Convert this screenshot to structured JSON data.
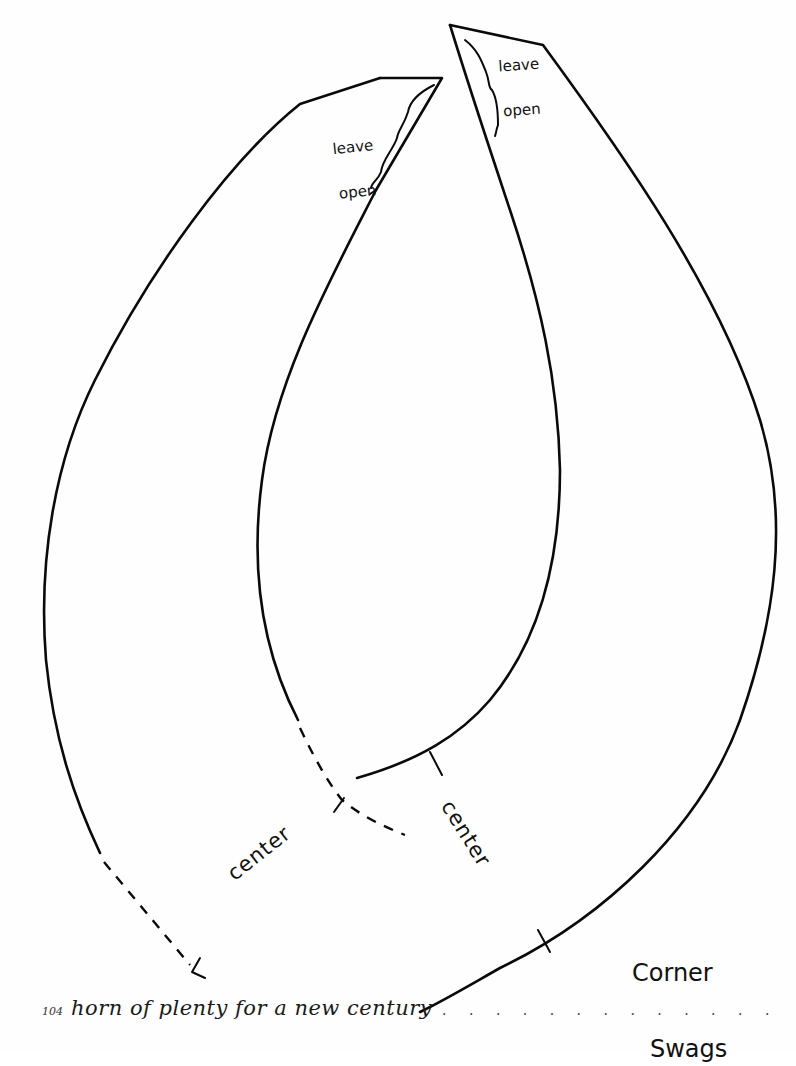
{
  "page": {
    "type": "sewing-pattern-template",
    "background": "#fefefe",
    "line_color": "#0a0a0a"
  },
  "pieces": [
    {
      "id": "left-piece",
      "opening_note": {
        "line1": "leave",
        "line2": "open"
      },
      "center_label": "center"
    },
    {
      "id": "right-piece",
      "opening_note": {
        "line1": "leave",
        "line2": "open"
      },
      "center_label": "center"
    }
  ],
  "pattern_title": {
    "line1": "Corner",
    "line2": "Swags"
  },
  "footer": {
    "page_number": "104",
    "book_title": "horn of plenty for a new century",
    "leader": ". . . . . . . . . . . . . . . . . . . . . . . ."
  }
}
